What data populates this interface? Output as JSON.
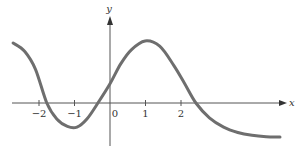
{
  "chart_data": {
    "type": "line",
    "title": "",
    "xlabel": "x",
    "ylabel": "y",
    "x_ticks": [
      -2,
      -1,
      0,
      1,
      2
    ],
    "x_tick_labels": [
      "−2",
      "−1",
      "0",
      "1",
      "2"
    ],
    "grid": false,
    "legend": null,
    "xlim": [
      -2.8,
      5.0
    ],
    "ylim": [
      -1.2,
      2.4
    ],
    "series": [
      {
        "name": "curve",
        "color": "#6e6e6e",
        "x": [
          -2.73,
          -2.4,
          -2.1,
          -1.78,
          -1.5,
          -1.2,
          -0.93,
          -0.65,
          -0.34,
          0.0,
          0.3,
          0.6,
          0.99,
          1.4,
          1.8,
          2.1,
          2.42,
          2.8,
          3.2,
          3.6,
          4.0,
          4.4,
          4.79
        ],
        "y": [
          1.69,
          1.45,
          0.95,
          0.0,
          -0.45,
          -0.66,
          -0.68,
          -0.45,
          0.0,
          0.54,
          1.1,
          1.5,
          1.75,
          1.6,
          1.05,
          0.55,
          0.0,
          -0.42,
          -0.68,
          -0.83,
          -0.91,
          -0.95,
          -0.96
        ]
      }
    ],
    "annotations": []
  },
  "axes": {
    "x_label": "x",
    "y_label": "y",
    "color": "#555555"
  },
  "style": {
    "curve_color": "#6e6e6e",
    "axis_color": "#555555",
    "background": "#ffffff"
  }
}
